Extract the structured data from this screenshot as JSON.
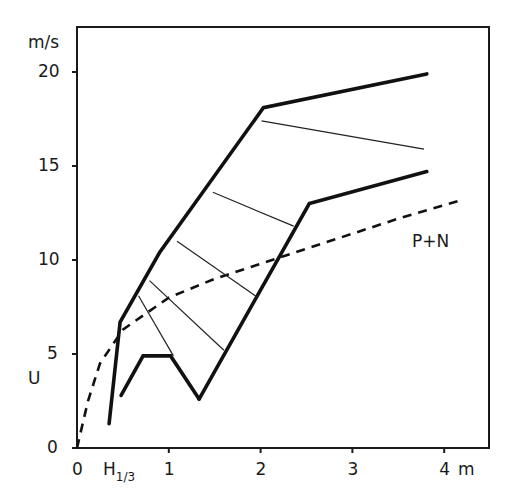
{
  "chart_data": {
    "type": "line",
    "title": "",
    "xlabel": "H1/3",
    "xunit": "m",
    "ylabel": "U",
    "yunit": "m/s",
    "xlim": [
      0,
      4.5
    ],
    "ylim": [
      0,
      22.4
    ],
    "xticks": [
      "0",
      "1",
      "2",
      "3",
      "4"
    ],
    "yticks": [
      "0",
      "5",
      "10",
      "15",
      "20"
    ],
    "grid": false,
    "series": [
      {
        "name": "upper boundary",
        "style": "thick-solid",
        "points": [
          [
            0.35,
            1.3
          ],
          [
            0.47,
            6.7
          ],
          [
            0.9,
            10.4
          ],
          [
            2.03,
            18.1
          ],
          [
            3.81,
            19.9
          ]
        ]
      },
      {
        "name": "upper-right thin line",
        "style": "thin-solid",
        "points": [
          [
            2.01,
            17.4
          ],
          [
            3.78,
            15.9
          ]
        ]
      },
      {
        "name": "lower boundary left",
        "style": "thick-solid",
        "points": [
          [
            0.48,
            2.8
          ],
          [
            0.72,
            4.9
          ],
          [
            1.02,
            4.9
          ],
          [
            1.33,
            2.6
          ]
        ]
      },
      {
        "name": "lower boundary right",
        "style": "thick-solid",
        "points": [
          [
            1.33,
            2.6
          ],
          [
            2.53,
            13.0
          ],
          [
            3.81,
            14.7
          ]
        ]
      },
      {
        "name": "P+N",
        "style": "dashed",
        "points": [
          [
            0.0,
            0.0
          ],
          [
            0.12,
            2.5
          ],
          [
            0.25,
            4.5
          ],
          [
            0.5,
            6.3
          ],
          [
            1.0,
            8.0
          ],
          [
            1.5,
            9.0
          ],
          [
            2.0,
            9.8
          ],
          [
            2.5,
            10.6
          ],
          [
            3.0,
            11.4
          ],
          [
            3.5,
            12.2
          ],
          [
            4.2,
            13.2
          ]
        ]
      }
    ],
    "rungs": [
      [
        [
          0.67,
          8.1
        ],
        [
          1.05,
          4.9
        ]
      ],
      [
        [
          0.79,
          8.9
        ],
        [
          1.6,
          5.2
        ]
      ],
      [
        [
          1.09,
          11.0
        ],
        [
          1.97,
          8.0
        ]
      ],
      [
        [
          1.48,
          13.6
        ],
        [
          2.36,
          11.8
        ]
      ]
    ],
    "annotations": [
      {
        "text": "P+N",
        "x": 3.85,
        "y": 11.1
      }
    ]
  },
  "labels": {
    "y_unit": "m/s",
    "y_name": "U",
    "x_name_main": "H",
    "x_name_sub": "1/3",
    "x_unit": "m",
    "curve_label": "P+N",
    "yticks": [
      "0",
      "5",
      "10",
      "15",
      "20"
    ],
    "xticks": [
      "0",
      "1",
      "2",
      "3",
      "4"
    ]
  }
}
